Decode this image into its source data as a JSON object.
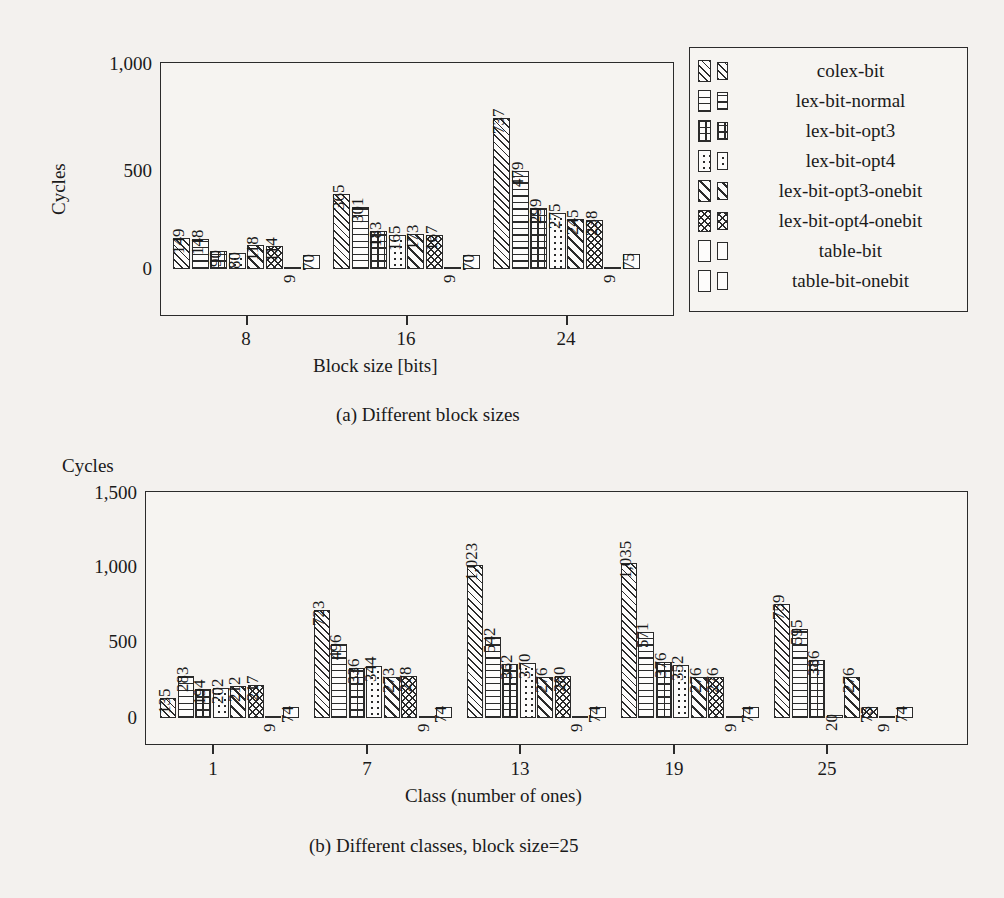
{
  "page": {
    "ghost_text_top": "m m of the effects of the ... reduced ...",
    "ghost_text_line2": "instructions"
  },
  "legend": {
    "entries": [
      {
        "label": "colex-bit",
        "pattern": "diagonal-hatch"
      },
      {
        "label": "lex-bit-normal",
        "pattern": "horizontal-lines"
      },
      {
        "label": "lex-bit-opt3",
        "pattern": "grid-hatch"
      },
      {
        "label": "lex-bit-opt4",
        "pattern": "dots"
      },
      {
        "label": "lex-bit-opt3-onebit",
        "pattern": "diagonal-hatch-bold"
      },
      {
        "label": "lex-bit-opt4-onebit",
        "pattern": "crosshatch"
      },
      {
        "label": "table-bit",
        "pattern": "solid-black"
      },
      {
        "label": "table-bit-onebit",
        "pattern": "empty-white"
      }
    ]
  },
  "chart_data": [
    {
      "id": "chart-a",
      "type": "bar",
      "title": "",
      "caption": "(a) Different block sizes",
      "xlabel": "Block size [bits]",
      "ylabel": "Cycles",
      "categories": [
        "8",
        "16",
        "24"
      ],
      "xticks": [
        "8",
        "16",
        "24"
      ],
      "yticks": [
        "0",
        "500",
        "1,000"
      ],
      "ylim": [
        0,
        1100
      ],
      "grid": false,
      "legend_position": "right-outside",
      "series": [
        {
          "name": "colex-bit",
          "values": [
            149,
            365,
            737
          ]
        },
        {
          "name": "lex-bit-normal",
          "values": [
            148,
            301,
            479
          ]
        },
        {
          "name": "lex-bit-opt3",
          "values": [
            90,
            183,
            299
          ]
        },
        {
          "name": "lex-bit-opt4",
          "values": [
            80,
            165,
            275
          ]
        },
        {
          "name": "lex-bit-opt3-onebit",
          "values": [
            118,
            173,
            245
          ]
        },
        {
          "name": "lex-bit-opt4-onebit",
          "values": [
            114,
            167,
            238
          ]
        },
        {
          "name": "table-bit",
          "values": [
            9,
            9,
            9
          ]
        },
        {
          "name": "table-bit-onebit",
          "values": [
            70,
            70,
            75
          ]
        }
      ]
    },
    {
      "id": "chart-b",
      "type": "bar",
      "title": "Cycles",
      "caption": "(b) Different classes, block size=25",
      "xlabel": "Class (number of ones)",
      "ylabel": "Cycles",
      "categories": [
        "1",
        "7",
        "13",
        "19",
        "25"
      ],
      "xticks": [
        "1",
        "7",
        "13",
        "19",
        "25"
      ],
      "yticks": [
        "0",
        "500",
        "1,000",
        "1,500"
      ],
      "ylim": [
        0,
        1600
      ],
      "grid": false,
      "legend_position": "none",
      "series": [
        {
          "name": "colex-bit",
          "values": [
            135,
            723,
            1023,
            1035,
            759
          ]
        },
        {
          "name": "lex-bit-normal",
          "values": [
            283,
            496,
            542,
            571,
            595
          ]
        },
        {
          "name": "lex-bit-opt3",
          "values": [
            194,
            336,
            362,
            376,
            386
          ]
        },
        {
          "name": "lex-bit-opt4",
          "values": [
            202,
            344,
            370,
            352,
            20
          ]
        },
        {
          "name": "lex-bit-opt3-onebit",
          "values": [
            212,
            273,
            276,
            276,
            276
          ]
        },
        {
          "name": "lex-bit-opt4-onebit",
          "values": [
            217,
            278,
            280,
            276,
            75
          ]
        },
        {
          "name": "table-bit",
          "values": [
            9,
            9,
            9,
            9,
            9
          ]
        },
        {
          "name": "table-bit-onebit",
          "values": [
            74,
            74,
            74,
            74,
            74
          ]
        }
      ]
    }
  ],
  "value_labels": {
    "chart_a": [
      [
        "149",
        "148",
        "90",
        "80",
        "118",
        "114",
        "9",
        "70"
      ],
      [
        "365",
        "301",
        "183",
        "165",
        "173",
        "167",
        "9",
        "70"
      ],
      [
        "737",
        "479",
        "299",
        "275",
        "245",
        "238",
        "9",
        "75"
      ]
    ],
    "chart_b": [
      [
        "135",
        "283",
        "194",
        "202",
        "212",
        "217",
        "9",
        "74"
      ],
      [
        "723",
        "496",
        "336",
        "344",
        "273",
        "278",
        "9",
        "74"
      ],
      [
        "1,023",
        "542",
        "362",
        "370",
        "276",
        "280",
        "9",
        "74"
      ],
      [
        "1,035",
        "571",
        "376",
        "352",
        "276",
        "276",
        "9",
        "74"
      ],
      [
        "759",
        "595",
        "386",
        "20",
        "276",
        "75",
        "9",
        "74"
      ]
    ]
  }
}
